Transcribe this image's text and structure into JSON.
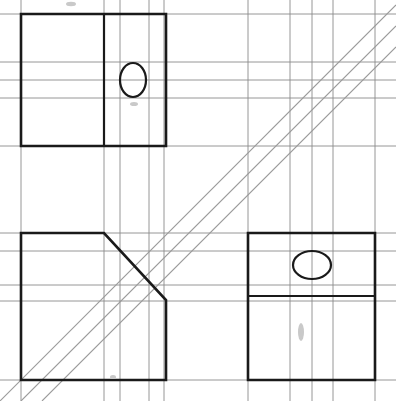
{
  "document": {
    "title": "Orthographic Projection Sketch on Grid Paper",
    "medium": "graph-paper",
    "background_color": "#ffffff",
    "grid_color": "#8a8a8a",
    "object_line_color": "#1a1a1a",
    "construction_line_color": "#9a9a9a",
    "width": 396,
    "height": 401
  },
  "chart_data": {
    "type": "line",
    "xlabel": "",
    "ylabel": "",
    "grid": true,
    "legend": "none",
    "xlim": [
      0,
      396
    ],
    "ylim": [
      0,
      401
    ],
    "grid_lines": {
      "vertical_x": [
        21,
        104,
        120,
        149,
        164,
        248,
        290,
        312,
        333,
        375
      ],
      "horizontal_y": [
        14,
        62,
        80,
        98,
        146,
        233,
        251,
        285,
        301,
        380
      ]
    },
    "series": [
      {
        "name": "top-view-outline",
        "type": "polygon",
        "points": [
          [
            21,
            14
          ],
          [
            166,
            14
          ],
          [
            166,
            146
          ],
          [
            21,
            146
          ]
        ]
      },
      {
        "name": "top-view-internal-edge",
        "type": "line",
        "points": [
          [
            104,
            14
          ],
          [
            104,
            146
          ]
        ]
      },
      {
        "name": "top-view-hole",
        "type": "ellipse",
        "cx": 133,
        "cy": 80,
        "rx": 13,
        "ry": 17
      },
      {
        "name": "front-view-outline",
        "type": "polygon",
        "points": [
          [
            21,
            233
          ],
          [
            104,
            233
          ],
          [
            166,
            300
          ],
          [
            166,
            380
          ],
          [
            21,
            380
          ]
        ]
      },
      {
        "name": "side-view-outline",
        "type": "polygon",
        "points": [
          [
            248,
            233
          ],
          [
            375,
            233
          ],
          [
            375,
            380
          ],
          [
            248,
            380
          ]
        ]
      },
      {
        "name": "side-view-internal-edge",
        "type": "line",
        "points": [
          [
            248,
            296
          ],
          [
            375,
            296
          ]
        ]
      },
      {
        "name": "side-view-hole",
        "type": "ellipse",
        "cx": 312,
        "cy": 265,
        "rx": 19,
        "ry": 14
      },
      {
        "name": "projection-construction-line-1",
        "type": "line",
        "points": [
          [
            0,
            401
          ],
          [
            396,
            5
          ]
        ]
      },
      {
        "name": "projection-construction-line-2",
        "type": "line",
        "points": [
          [
            21,
            401
          ],
          [
            396,
            26
          ]
        ]
      },
      {
        "name": "projection-construction-line-3",
        "type": "line",
        "points": [
          [
            42,
            401
          ],
          [
            396,
            47
          ]
        ]
      }
    ]
  },
  "views": {
    "top_left": {
      "name": "Top View",
      "has_hole": true,
      "hole_shape": "vertical-ellipse"
    },
    "bottom_left": {
      "name": "Front View",
      "has_chamfer": true,
      "chamfer_angle_degrees": 45
    },
    "bottom_right": {
      "name": "Side View",
      "has_hole": true,
      "hole_shape": "horizontal-ellipse"
    }
  }
}
